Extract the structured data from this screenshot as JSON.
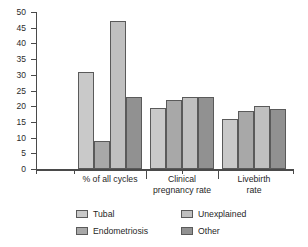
{
  "chart_data": {
    "type": "bar",
    "title": "",
    "subtitle": "",
    "xlabel": "",
    "ylabel": "",
    "ylim": [
      0,
      50
    ],
    "yticks": [
      0,
      5,
      10,
      15,
      20,
      25,
      30,
      35,
      40,
      45,
      50
    ],
    "grid": false,
    "legend_position": "bottom",
    "categories": [
      "% of all cycles",
      "Clinical\npregnancy rate",
      "Livebirth\nrate"
    ],
    "series": [
      {
        "name": "Tubal",
        "color": "#c9c9c9",
        "values": [
          31,
          19.5,
          16
        ]
      },
      {
        "name": "Endometriosis",
        "color": "#a8a8a8",
        "values": [
          9,
          22,
          18.5
        ]
      },
      {
        "name": "Unexplained",
        "color": "#c0c0c0",
        "values": [
          47,
          23,
          20
        ]
      },
      {
        "name": "Other",
        "color": "#919191",
        "values": [
          23,
          23,
          19
        ]
      }
    ]
  },
  "axis": {
    "y_tick_labels": [
      "0",
      "5",
      "10",
      "15",
      "20",
      "25",
      "30",
      "35",
      "40",
      "45",
      "50"
    ]
  },
  "categories_display": {
    "g0": "% of all cycles",
    "g1_line1": "Clinical",
    "g1_line2": "pregnancy rate",
    "g2_line1": "Livebirth",
    "g2_line2": "rate"
  },
  "legend": {
    "items": [
      {
        "label": "Tubal",
        "color": "#c9c9c9"
      },
      {
        "label": "Unexplained",
        "color": "#c0c0c0"
      },
      {
        "label": "Endometriosis",
        "color": "#a8a8a8"
      },
      {
        "label": "Other",
        "color": "#919191"
      }
    ]
  }
}
